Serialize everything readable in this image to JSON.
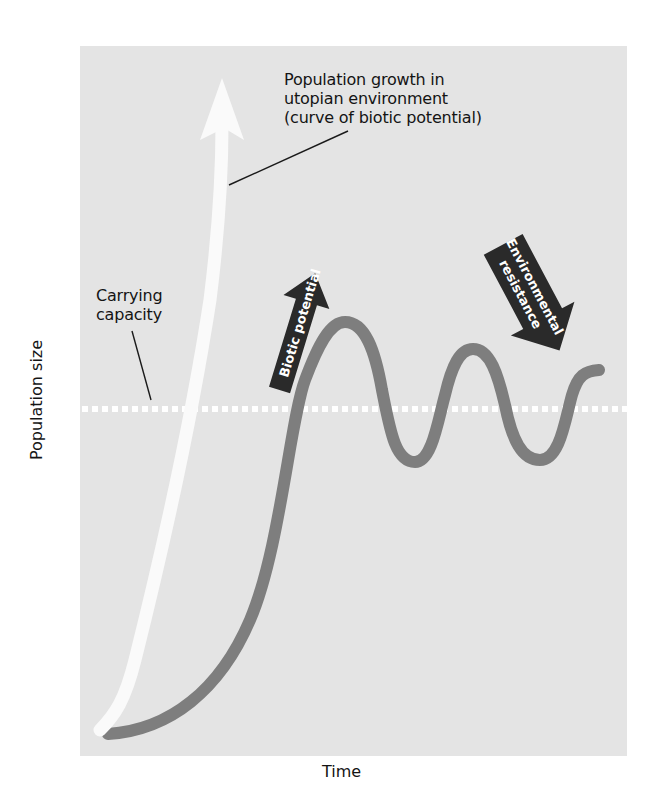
{
  "figure": {
    "axes": {
      "x_label": "Time",
      "y_label": "Population size"
    },
    "annotations": {
      "utopian_growth": {
        "lines": [
          "Population growth in",
          "utopian environment",
          "(curve of biotic potential)"
        ]
      },
      "carrying_capacity": {
        "lines": [
          "Carrying",
          "capacity"
        ]
      },
      "biotic_potential_arrow": "Biotic potential",
      "environmental_resistance_arrow": {
        "lines": [
          "Environmental",
          "resistance"
        ]
      }
    },
    "colors": {
      "panel_background": "#e4e4e4",
      "utopian_curve": "#fafafa",
      "actual_curve": "#7e7e7e",
      "carrying_capacity_line": "#ffffff",
      "arrow_fill": "#2a2a2a",
      "arrow_text": "#ffffff"
    }
  }
}
